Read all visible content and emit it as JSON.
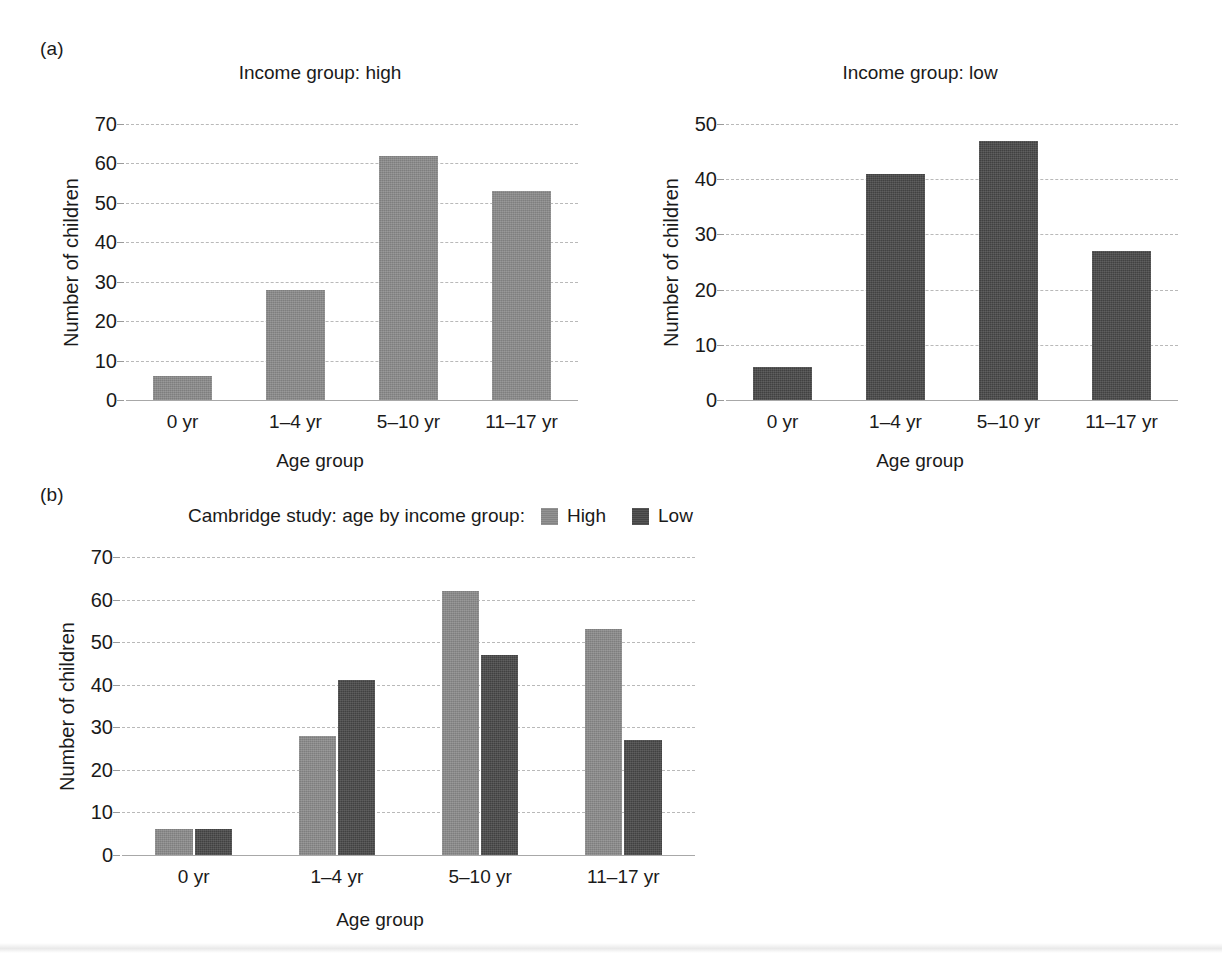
{
  "figure": {
    "panel_a_letter": "(a)",
    "panel_b_letter": "(b)"
  },
  "chart_data": [
    {
      "id": "high",
      "type": "bar",
      "title": "Income group: high",
      "xlabel": "Age group",
      "ylabel": "Number of children",
      "categories": [
        "0 yr",
        "1–4 yr",
        "5–10 yr",
        "11–17 yr"
      ],
      "values": [
        6,
        28,
        62,
        53
      ],
      "ylim": [
        0,
        70
      ],
      "yticks": [
        0,
        10,
        20,
        30,
        40,
        50,
        60,
        70
      ],
      "grid": true,
      "legend": "none",
      "bar_color": "#8a8a8a"
    },
    {
      "id": "low",
      "type": "bar",
      "title": "Income group: low",
      "xlabel": "Age group",
      "ylabel": "Number of children",
      "categories": [
        "0 yr",
        "1–4 yr",
        "5–10 yr",
        "11–17 yr"
      ],
      "values": [
        6,
        41,
        47,
        27
      ],
      "ylim": [
        0,
        50
      ],
      "yticks": [
        0,
        10,
        20,
        30,
        40,
        50
      ],
      "grid": true,
      "legend": "none",
      "bar_color": "#484848"
    },
    {
      "id": "combined",
      "type": "bar",
      "title": "Cambridge study: age by income group:",
      "xlabel": "Age group",
      "ylabel": "Number of children",
      "categories": [
        "0 yr",
        "1–4 yr",
        "5–10 yr",
        "11–17 yr"
      ],
      "series": [
        {
          "name": "High",
          "values": [
            6,
            28,
            62,
            53
          ],
          "color": "#8a8a8a"
        },
        {
          "name": "Low",
          "values": [
            6,
            41,
            47,
            27
          ],
          "color": "#484848"
        }
      ],
      "ylim": [
        0,
        70
      ],
      "yticks": [
        0,
        10,
        20,
        30,
        40,
        50,
        60,
        70
      ],
      "grid": true,
      "legend": "top-right"
    }
  ]
}
